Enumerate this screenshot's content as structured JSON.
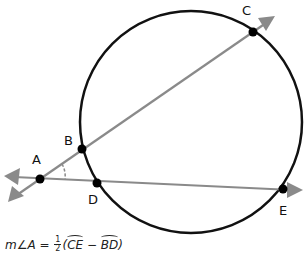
{
  "diagram": {
    "type": "geometry",
    "colors": {
      "circle": "#111111",
      "lines": "#888888",
      "points": "#000000"
    },
    "circle": {
      "cx": 191,
      "cy": 122,
      "r": 111
    },
    "points": {
      "A": {
        "label": "A",
        "x": 40,
        "y": 179
      },
      "B": {
        "label": "B",
        "x": 82,
        "y": 149
      },
      "C": {
        "label": "C",
        "x": 253,
        "y": 32
      },
      "D": {
        "label": "D",
        "x": 97,
        "y": 183
      },
      "E": {
        "label": "E",
        "x": 283,
        "y": 189
      }
    },
    "secants": [
      {
        "name": "secant-ABC",
        "through": [
          "A",
          "B",
          "C"
        ]
      },
      {
        "name": "secant-ADE",
        "through": [
          "A",
          "D",
          "E"
        ]
      }
    ],
    "angle_mark": "A",
    "formula": {
      "lhs": "m∠A =",
      "frac_num": "1",
      "frac_den": "2",
      "open": "(",
      "arc1": "CE",
      "minus": " − ",
      "arc2": "BD",
      "close": ")"
    }
  }
}
